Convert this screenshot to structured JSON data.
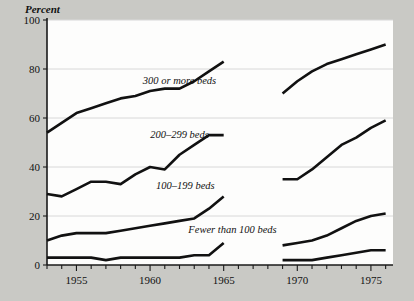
{
  "figure": {
    "background_color": "#c9c9c5",
    "plot_background_color": "#fdfdfc",
    "line_color": "#111111",
    "grid_color": "#d8d8d8"
  },
  "axis": {
    "y_title": "Percent",
    "y_ticks": [
      "0",
      "20",
      "40",
      "60",
      "80",
      "100"
    ],
    "x_ticks": [
      "1955",
      "1960",
      "1965",
      "1970",
      "1975"
    ]
  },
  "series_labels": [
    {
      "text": "300 or more beds"
    },
    {
      "text": "200–299 beds"
    },
    {
      "text": "100–199 beds"
    },
    {
      "text": "Fewer than 100 beds"
    }
  ],
  "chart_data": {
    "type": "line",
    "title": "",
    "subtitle": "",
    "xlabel": "",
    "ylabel": "Percent",
    "xlim": [
      1953,
      1976.5
    ],
    "ylim": [
      0,
      100
    ],
    "grid": true,
    "gridlines_y": [
      20,
      40,
      60,
      80,
      100
    ],
    "x_tick_labels": [
      1955,
      1960,
      1965,
      1970,
      1975
    ],
    "x_minor_tick_interval": 1,
    "y_tick_labels": [
      0,
      20,
      40,
      60,
      80,
      100
    ],
    "legend_position": "inline-annotations",
    "note": "Data series are broken between 1965 and 1969; each series has two segments.",
    "series": [
      {
        "name": "300 or more beds",
        "label_position": {
          "x": 1962.0,
          "y": 74
        },
        "segments": [
          {
            "x": [
              1953,
              1954,
              1955,
              1956,
              1957,
              1958,
              1959,
              1960,
              1961,
              1962,
              1963,
              1964,
              1965
            ],
            "values": [
              54,
              58,
              62,
              64,
              66,
              68,
              69,
              71,
              72,
              72,
              75,
              79,
              83
            ]
          },
          {
            "x": [
              1969,
              1970,
              1971,
              1972,
              1973,
              1974,
              1975,
              1976
            ],
            "values": [
              70,
              75,
              79,
              82,
              84,
              86,
              88,
              90
            ]
          }
        ]
      },
      {
        "name": "200–299 beds",
        "label_position": {
          "x": 1962.0,
          "y": 52
        },
        "segments": [
          {
            "x": [
              1953,
              1954,
              1955,
              1956,
              1957,
              1958,
              1959,
              1960,
              1961,
              1962,
              1963,
              1964,
              1965
            ],
            "values": [
              29,
              28,
              31,
              34,
              34,
              33,
              37,
              40,
              39,
              45,
              49,
              53,
              53
            ]
          },
          {
            "x": [
              1969,
              1970,
              1971,
              1972,
              1973,
              1974,
              1975,
              1976
            ],
            "values": [
              35,
              35,
              39,
              44,
              49,
              52,
              56,
              59
            ]
          }
        ]
      },
      {
        "name": "100–199 beds",
        "label_position": {
          "x": 1962.4,
          "y": 31
        },
        "segments": [
          {
            "x": [
              1953,
              1954,
              1955,
              1956,
              1957,
              1958,
              1959,
              1960,
              1961,
              1962,
              1963,
              1964,
              1965
            ],
            "values": [
              10,
              12,
              13,
              13,
              13,
              14,
              15,
              16,
              17,
              18,
              19,
              23,
              28
            ]
          },
          {
            "x": [
              1969,
              1970,
              1971,
              1972,
              1973,
              1974,
              1975,
              1976
            ],
            "values": [
              8,
              9,
              10,
              12,
              15,
              18,
              20,
              21
            ]
          }
        ]
      },
      {
        "name": "Fewer than 100 beds",
        "label_position": {
          "x": 1965.6,
          "y": 13
        },
        "segments": [
          {
            "x": [
              1953,
              1954,
              1955,
              1956,
              1957,
              1958,
              1959,
              1960,
              1961,
              1962,
              1963,
              1964,
              1965
            ],
            "values": [
              3,
              3,
              3,
              3,
              2,
              3,
              3,
              3,
              3,
              3,
              4,
              4,
              9
            ]
          },
          {
            "x": [
              1969,
              1970,
              1971,
              1972,
              1973,
              1974,
              1975,
              1976
            ],
            "values": [
              2,
              2,
              2,
              3,
              4,
              5,
              6,
              6
            ]
          }
        ]
      }
    ]
  }
}
